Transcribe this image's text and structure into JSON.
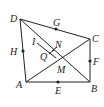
{
  "diagram": {
    "points": {
      "D": {
        "label": "D",
        "x": 20,
        "y": 19
      },
      "G": {
        "label": "G",
        "x": 56,
        "y": 29
      },
      "C": {
        "label": "C",
        "x": 90,
        "y": 39
      },
      "F": {
        "label": "F",
        "x": 90,
        "y": 61
      },
      "B": {
        "label": "B",
        "x": 90,
        "y": 82
      },
      "E": {
        "label": "E",
        "x": 58,
        "y": 82
      },
      "A": {
        "label": "A",
        "x": 26,
        "y": 82
      },
      "H": {
        "label": "H",
        "x": 23,
        "y": 51
      },
      "N": {
        "label": "N",
        "x": 57,
        "y": 46
      },
      "M": {
        "label": "M",
        "x": 60,
        "y": 60
      },
      "Q": {
        "label": "Q",
        "x": 45,
        "y": 55
      },
      "I": {
        "label": "I",
        "x": 36,
        "y": 42
      }
    },
    "segments": [
      "DC",
      "CB",
      "BA",
      "AD",
      "DB",
      "AC",
      "IN-parallel"
    ],
    "midpoints": [
      "G",
      "F",
      "E",
      "H"
    ],
    "colors": {
      "stroke": "#222222",
      "background": "#ffffff"
    }
  }
}
